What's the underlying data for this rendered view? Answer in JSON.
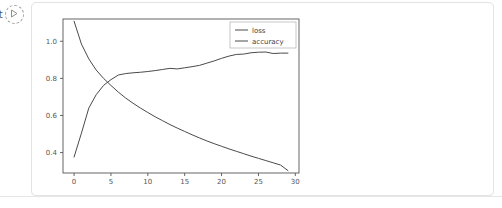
{
  "run_control": {
    "text_fragment": "rt",
    "icon": "play-circle-icon"
  },
  "chart_data": {
    "type": "line",
    "title": "",
    "xlabel": "",
    "ylabel": "",
    "xlim": [
      -1.5,
      30.5
    ],
    "ylim": [
      0.29,
      1.12
    ],
    "grid": false,
    "legend_position": "upper right",
    "xticks": [
      "0",
      "5",
      "10",
      "15",
      "20",
      "25",
      "30"
    ],
    "xtick_values": [
      0,
      5,
      10,
      15,
      20,
      25,
      30
    ],
    "yticks": [
      "1.0",
      "0.8",
      "0.6",
      "0.4"
    ],
    "ytick_values": [
      1.0,
      0.8,
      0.6,
      0.4
    ],
    "x": [
      0,
      1,
      2,
      3,
      4,
      5,
      6,
      7,
      8,
      9,
      10,
      11,
      12,
      13,
      14,
      15,
      16,
      17,
      18,
      19,
      20,
      21,
      22,
      23,
      24,
      25,
      26,
      27,
      28,
      29
    ],
    "series": [
      {
        "name": "loss",
        "color": "#4a4a4a",
        "values": [
          1.108,
          0.985,
          0.905,
          0.845,
          0.8,
          0.762,
          0.726,
          0.694,
          0.666,
          0.64,
          0.616,
          0.593,
          0.572,
          0.551,
          0.532,
          0.514,
          0.496,
          0.479,
          0.463,
          0.448,
          0.434,
          0.42,
          0.407,
          0.394,
          0.381,
          0.369,
          0.357,
          0.345,
          0.333,
          0.303
        ]
      },
      {
        "name": "accuracy",
        "color": "#4a4a4a",
        "values": [
          0.376,
          0.505,
          0.64,
          0.712,
          0.762,
          0.793,
          0.818,
          0.826,
          0.83,
          0.833,
          0.837,
          0.842,
          0.848,
          0.854,
          0.851,
          0.857,
          0.863,
          0.87,
          0.882,
          0.894,
          0.908,
          0.92,
          0.929,
          0.931,
          0.938,
          0.941,
          0.942,
          0.934,
          0.936,
          0.936
        ]
      }
    ],
    "legend_entries": [
      {
        "label": "loss",
        "color": "#4a4a4a"
      },
      {
        "label": "accuracy",
        "color": "#4a4a4a"
      }
    ],
    "colors": {
      "axes_spine": "#555555",
      "tick_text": "#555555",
      "legend_border": "#b8b8b8",
      "figure_background": "#ffffff"
    }
  }
}
